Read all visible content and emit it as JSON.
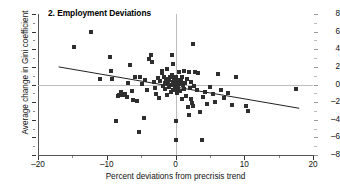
{
  "chart_data": {
    "type": "scatter",
    "title": "2. Employment Deviations",
    "xlabel": "Percent deviations from precrisis trend",
    "ylabel": "Average change in Gini coefficient",
    "xlim": [
      -20,
      20
    ],
    "ylim": [
      -8,
      8
    ],
    "xticks": [
      -20,
      -10,
      0,
      10,
      20
    ],
    "xticklabels": [
      "–20",
      "–10",
      "0",
      "10",
      "20"
    ],
    "yticks": [
      -8,
      -6,
      -4,
      -2,
      0,
      2,
      4,
      6,
      8
    ],
    "yticklabels": [
      "–8",
      "–6",
      "–4",
      "–2",
      "0",
      "2",
      "4",
      "6",
      "8"
    ],
    "grid": false,
    "legend": null,
    "reference_lines": [
      {
        "axis": "y",
        "value": 0,
        "color": "#bdbdbd"
      },
      {
        "axis": "x",
        "value": 0,
        "color": "#bdbdbd"
      }
    ],
    "trendline": {
      "x": [
        -17.0,
        18.0
      ],
      "y": [
        2.0,
        -2.7
      ],
      "color": "#222222",
      "slope": -0.134,
      "intercept": -0.28
    },
    "marker": {
      "shape": "square",
      "color": "#2e2e2e",
      "size": 4
    },
    "points": [
      [
        -14.8,
        4.3
      ],
      [
        -12.3,
        6.0
      ],
      [
        -11.0,
        0.6
      ],
      [
        -9.6,
        3.1
      ],
      [
        -9.4,
        1.5
      ],
      [
        -9.2,
        0.6
      ],
      [
        -8.6,
        -4.1
      ],
      [
        -8.4,
        -1.3
      ],
      [
        -8.2,
        -1.2
      ],
      [
        -7.9,
        -0.9
      ],
      [
        -7.6,
        -1.2
      ],
      [
        -7.4,
        -1.1
      ],
      [
        -7.1,
        -1.4
      ],
      [
        -6.9,
        0.2
      ],
      [
        -6.6,
        2.2
      ],
      [
        -6.4,
        -0.7
      ],
      [
        -6.2,
        -1.8
      ],
      [
        -5.9,
        0.9
      ],
      [
        -5.6,
        -1.9
      ],
      [
        -5.3,
        -5.4
      ],
      [
        -5.1,
        0.8
      ],
      [
        -4.9,
        0.1
      ],
      [
        -4.6,
        -3.8
      ],
      [
        -4.4,
        0.5
      ],
      [
        -4.2,
        -0.6
      ],
      [
        -3.9,
        2.9
      ],
      [
        -3.6,
        3.4
      ],
      [
        -3.4,
        2.6
      ],
      [
        -3.2,
        0.3
      ],
      [
        -3.0,
        -0.4
      ],
      [
        -2.8,
        -1.1
      ],
      [
        -2.6,
        0.7
      ],
      [
        -2.4,
        -1.5
      ],
      [
        -2.2,
        0.4
      ],
      [
        -2.0,
        1.5
      ],
      [
        -1.9,
        1.3
      ],
      [
        -1.8,
        -0.2
      ],
      [
        -1.7,
        0.9
      ],
      [
        -1.6,
        0.2
      ],
      [
        -1.5,
        -0.5
      ],
      [
        -1.4,
        0.6
      ],
      [
        -1.3,
        1.8
      ],
      [
        -1.2,
        -1.2
      ],
      [
        -1.1,
        0.1
      ],
      [
        -1.0,
        0.5
      ],
      [
        -0.9,
        -0.3
      ],
      [
        -0.8,
        0.8
      ],
      [
        -0.7,
        0.0
      ],
      [
        -0.6,
        -0.8
      ],
      [
        -0.5,
        1.1
      ],
      [
        -0.5,
        3.4
      ],
      [
        -0.4,
        0.3
      ],
      [
        -0.3,
        -0.6
      ],
      [
        -0.3,
        2.3
      ],
      [
        -0.2,
        0.6
      ],
      [
        -0.1,
        -0.2
      ],
      [
        0.0,
        0.9
      ],
      [
        0.0,
        -0.5
      ],
      [
        0.0,
        -4.1
      ],
      [
        0.0,
        -6.3
      ],
      [
        0.1,
        0.2
      ],
      [
        0.2,
        -1.0
      ],
      [
        0.3,
        0.5
      ],
      [
        0.4,
        -0.3
      ],
      [
        0.5,
        1.4
      ],
      [
        0.6,
        0.1
      ],
      [
        0.7,
        -0.7
      ],
      [
        0.8,
        0.4
      ],
      [
        0.9,
        -1.6
      ],
      [
        1.0,
        0.8
      ],
      [
        1.1,
        -0.1
      ],
      [
        1.2,
        1.5
      ],
      [
        1.3,
        -0.5
      ],
      [
        1.4,
        0.2
      ],
      [
        1.5,
        -1.3
      ],
      [
        1.6,
        0.6
      ],
      [
        1.8,
        -2.6
      ],
      [
        1.9,
        -3.5
      ],
      [
        2.0,
        1.4
      ],
      [
        2.1,
        -0.4
      ],
      [
        2.2,
        -1.7
      ],
      [
        2.3,
        0.3
      ],
      [
        2.4,
        -2.1
      ],
      [
        2.5,
        4.6
      ],
      [
        2.6,
        -2.4
      ],
      [
        2.7,
        -0.2
      ],
      [
        2.9,
        1.4
      ],
      [
        3.1,
        -0.6
      ],
      [
        3.3,
        1.3
      ],
      [
        3.5,
        -3.1
      ],
      [
        3.8,
        -6.3
      ],
      [
        4.0,
        -1.4
      ],
      [
        4.3,
        -0.9
      ],
      [
        4.6,
        -2.2
      ],
      [
        5.0,
        -0.3
      ],
      [
        5.4,
        -1.1
      ],
      [
        5.8,
        -2.0
      ],
      [
        6.2,
        1.2
      ],
      [
        6.6,
        -0.6
      ],
      [
        7.0,
        -1.5
      ],
      [
        7.6,
        -1.0
      ],
      [
        8.2,
        -2.3
      ],
      [
        8.8,
        0.8
      ],
      [
        10.3,
        -2.4
      ],
      [
        10.6,
        -3.0
      ],
      [
        17.5,
        -0.5
      ]
    ]
  }
}
